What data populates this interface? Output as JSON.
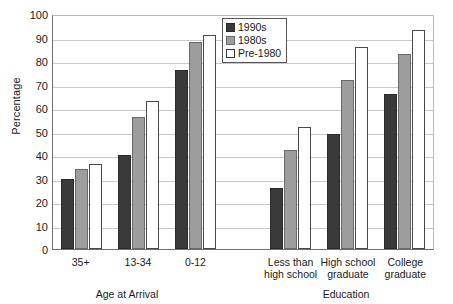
{
  "chart_data": {
    "type": "bar",
    "title": "",
    "xlabel": "",
    "ylabel": "Percentage",
    "ylim": [
      0,
      100
    ],
    "ytick_step": 10,
    "yticks": [
      100,
      90,
      80,
      70,
      60,
      50,
      40,
      30,
      20,
      10,
      0
    ],
    "grid": true,
    "legend_position": "top-center",
    "categories": [
      "35+",
      "13-34",
      "0-12",
      "",
      "Less than high school",
      "High school graduate",
      "College graduate"
    ],
    "category_lines": [
      [
        "35+"
      ],
      [
        "13-34"
      ],
      [
        "0-12"
      ],
      [
        ""
      ],
      [
        "Less than",
        "high school"
      ],
      [
        "High school",
        "graduate"
      ],
      [
        "College",
        "graduate"
      ]
    ],
    "panels": [
      {
        "name": "Age at Arrival",
        "categories": [
          "35+",
          "13-34",
          "0-12"
        ]
      },
      {
        "name": "Education",
        "categories": [
          "Less than high school",
          "High school graduate",
          "College graduate"
        ]
      }
    ],
    "series": [
      {
        "name": "1990s",
        "color": "#3a3a3a",
        "values": [
          30,
          40,
          76,
          null,
          26,
          49,
          66
        ]
      },
      {
        "name": "1980s",
        "color": "#9d9d9d",
        "values": [
          34,
          56,
          88,
          null,
          42,
          72,
          83
        ]
      },
      {
        "name": "Pre-1980",
        "color": "#ffffff",
        "values": [
          36,
          63,
          91,
          null,
          52,
          86,
          93
        ]
      }
    ]
  },
  "legend": {
    "items": [
      {
        "label": "1990s"
      },
      {
        "label": "1980s"
      },
      {
        "label": "Pre-1980"
      }
    ]
  },
  "axis": {
    "y_title": "Percentage",
    "panel_titles": [
      "Age at Arrival",
      "Education"
    ]
  }
}
